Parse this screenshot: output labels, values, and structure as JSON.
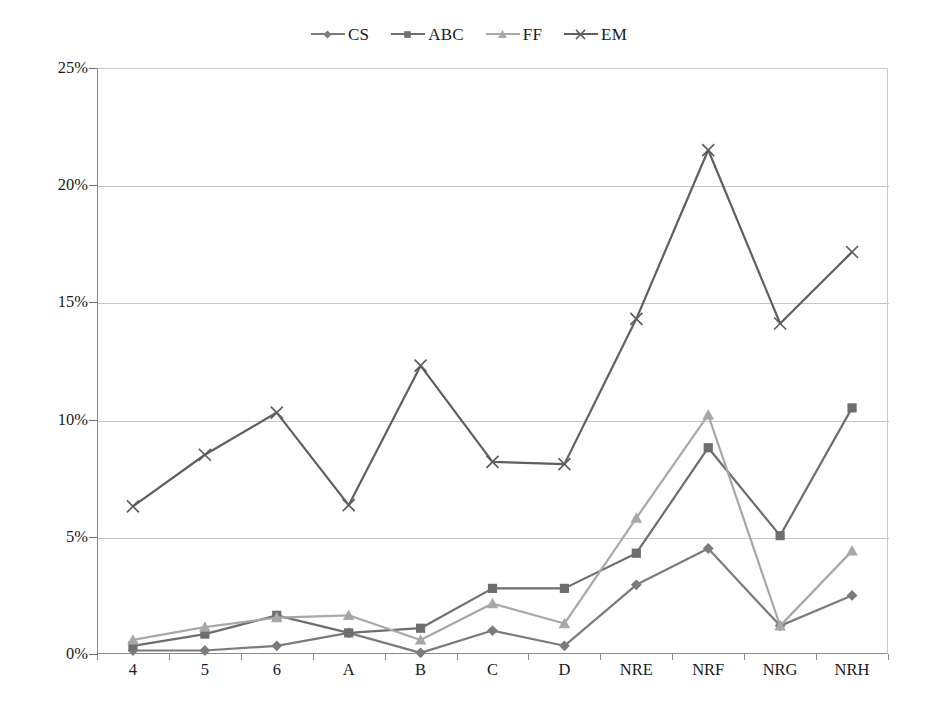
{
  "chart_data": {
    "type": "line",
    "title": "",
    "subtitle": "",
    "xlabel": "",
    "ylabel": "",
    "categories": [
      "4",
      "5",
      "6",
      "A",
      "B",
      "C",
      "D",
      "NRE",
      "NRF",
      "NRG",
      "NRH"
    ],
    "ylim": [
      0,
      25
    ],
    "ytick_labels": [
      "0%",
      "5%",
      "10%",
      "15%",
      "20%",
      "25%"
    ],
    "ytick_values": [
      0,
      5,
      10,
      15,
      20,
      25
    ],
    "y_unit": "%",
    "grid": "horizontal",
    "legend_position": "top-center",
    "series": [
      {
        "name": "CS",
        "marker": "diamond",
        "color": "#7b7b7b",
        "values": [
          0.15,
          0.15,
          0.35,
          0.9,
          0.05,
          1.0,
          0.35,
          2.95,
          4.5,
          1.2,
          2.5
        ]
      },
      {
        "name": "ABC",
        "marker": "square",
        "color": "#6e6e6e",
        "values": [
          0.35,
          0.85,
          1.65,
          0.9,
          1.1,
          2.8,
          2.8,
          4.3,
          8.8,
          5.05,
          10.5
        ]
      },
      {
        "name": "FF",
        "marker": "triangle",
        "color": "#a8a8a8",
        "values": [
          0.6,
          1.15,
          1.55,
          1.65,
          0.6,
          2.15,
          1.3,
          5.8,
          10.2,
          1.2,
          4.4
        ]
      },
      {
        "name": "EM",
        "marker": "cross",
        "color": "#5f5f5f",
        "values": [
          6.3,
          8.5,
          10.3,
          6.35,
          12.3,
          8.2,
          8.1,
          14.3,
          21.5,
          14.1,
          17.15
        ]
      }
    ]
  },
  "legend": {
    "entries": [
      {
        "label": "CS"
      },
      {
        "label": "ABC"
      },
      {
        "label": "FF"
      },
      {
        "label": "EM"
      }
    ]
  },
  "colors": {
    "background": "#ffffff",
    "gridline": "#c4c4c4",
    "axis": "#8b8b8b",
    "text": "#1a1a1a"
  }
}
